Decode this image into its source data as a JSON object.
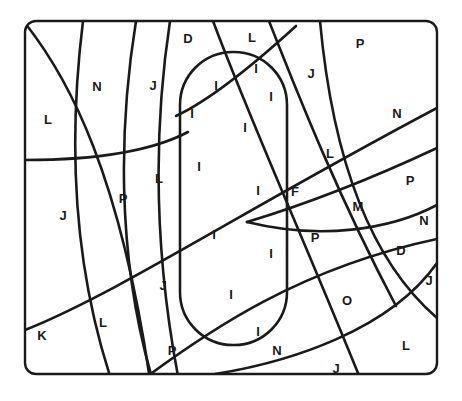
{
  "canvas": {
    "width": 462,
    "height": 401,
    "background": "#ffffff"
  },
  "style": {
    "stroke_color": "#1a1a1a",
    "frame_stroke_width": 2.4,
    "curve_stroke_width": 2.6,
    "capsule_stroke_width": 2.6,
    "label_color": "#1a1a1a",
    "label_font_size": 13,
    "label_font_weight": 700
  },
  "frame": {
    "name": "outer-rounded-rectangle",
    "x": 25,
    "y": 21,
    "width": 412,
    "height": 353,
    "corner_radius": 11
  },
  "capsule": {
    "name": "center-capsule",
    "x": 180,
    "y": 52,
    "width": 107,
    "height": 293,
    "corner_radius": 53
  },
  "curves": [
    {
      "id": "c1",
      "name": "arc-upper-left-diagonal",
      "d": "M 25 23 C 70 80 120 175 150 380"
    },
    {
      "id": "c2",
      "name": "arc-left-vertical-1",
      "d": "M 83 21 C 72 110 66 240 110 376"
    },
    {
      "id": "c3",
      "name": "arc-left-vertical-2",
      "d": "M 136 21 C 120 120 115 250 152 378"
    },
    {
      "id": "c4",
      "name": "arc-left-vertical-3",
      "d": "M 170 21 C 152 140 156 260 178 376"
    },
    {
      "id": "c5",
      "name": "arc-horizontal-left-mid",
      "d": "M 25 160 C 90 160 150 152 188 132"
    },
    {
      "id": "c6",
      "name": "arc-long-diagonal-lower-left",
      "d": "M 25 330 C 120 292 240 212 437 108"
    },
    {
      "id": "c7",
      "name": "arc-diagonal-upper-mid",
      "d": "M 213 21 C 250 120 300 230 360 378"
    },
    {
      "id": "c8",
      "name": "arc-diagonal-right-upper",
      "d": "M 269 21 C 300 100 340 200 396 306"
    },
    {
      "id": "c9",
      "name": "arc-sweep-right-1",
      "d": "M 320 21 C 330 130 358 250 437 318"
    },
    {
      "id": "c10",
      "name": "arc-horizontal-right-mid",
      "d": "M 247 222 C 320 200 390 170 437 148"
    },
    {
      "id": "c11",
      "name": "arc-horizontal-right-low",
      "d": "M 247 222 C 320 240 390 230 437 205"
    },
    {
      "id": "c12",
      "name": "arc-lower-sweep",
      "d": "M 145 378 C 210 330 300 268 437 239"
    },
    {
      "id": "c13",
      "name": "arc-bottom-right-sweep",
      "d": "M 215 374 C 290 362 390 330 437 263"
    },
    {
      "id": "c14",
      "name": "arc-capsule-diagonal",
      "d": "M 176 116 C 210 100 250 68 296 26"
    }
  ],
  "labels": [
    {
      "text": "D",
      "x": 188,
      "y": 38,
      "region": "top-center-left"
    },
    {
      "text": "L",
      "x": 252,
      "y": 37,
      "region": "top-center"
    },
    {
      "text": "P",
      "x": 360,
      "y": 43,
      "region": "top-right"
    },
    {
      "text": "N",
      "x": 97,
      "y": 86,
      "region": "upper-left"
    },
    {
      "text": "J",
      "x": 153,
      "y": 85,
      "region": "upper-left-inner"
    },
    {
      "text": "I",
      "x": 256,
      "y": 68,
      "region": "capsule-top-right"
    },
    {
      "text": "I",
      "x": 216,
      "y": 85,
      "region": "capsule-top"
    },
    {
      "text": "J",
      "x": 311,
      "y": 73,
      "region": "upper-right-inner"
    },
    {
      "text": "L",
      "x": 48,
      "y": 119,
      "region": "left-upper"
    },
    {
      "text": "I",
      "x": 192,
      "y": 113,
      "region": "capsule-upper-left"
    },
    {
      "text": "I",
      "x": 271,
      "y": 96,
      "region": "capsule-upper-right"
    },
    {
      "text": "N",
      "x": 397,
      "y": 113,
      "region": "right-upper"
    },
    {
      "text": "I",
      "x": 245,
      "y": 127,
      "region": "capsule-mid-upper"
    },
    {
      "text": "L",
      "x": 159,
      "y": 178,
      "region": "left-mid-inner"
    },
    {
      "text": "I",
      "x": 199,
      "y": 166,
      "region": "capsule-mid-left"
    },
    {
      "text": "L",
      "x": 330,
      "y": 153,
      "region": "right-mid"
    },
    {
      "text": "P",
      "x": 410,
      "y": 180,
      "region": "right-col-1"
    },
    {
      "text": "P",
      "x": 123,
      "y": 198,
      "region": "left-mid"
    },
    {
      "text": "I",
      "x": 258,
      "y": 190,
      "region": "capsule-center"
    },
    {
      "text": "F",
      "x": 295,
      "y": 191,
      "region": "right-of-capsule"
    },
    {
      "text": "J",
      "x": 63,
      "y": 215,
      "region": "left-lower-mid"
    },
    {
      "text": "M",
      "x": 358,
      "y": 206,
      "region": "right-m"
    },
    {
      "text": "N",
      "x": 424,
      "y": 220,
      "region": "right-col-2"
    },
    {
      "text": "I",
      "x": 214,
      "y": 234,
      "region": "capsule-lower-center"
    },
    {
      "text": "P",
      "x": 315,
      "y": 237,
      "region": "right-p"
    },
    {
      "text": "D",
      "x": 401,
      "y": 250,
      "region": "right-col-3"
    },
    {
      "text": "I",
      "x": 271,
      "y": 253,
      "region": "capsule-lower-right"
    },
    {
      "text": "J",
      "x": 429,
      "y": 280,
      "region": "right-col-4"
    },
    {
      "text": "J",
      "x": 163,
      "y": 285,
      "region": "left-lower-j"
    },
    {
      "text": "I",
      "x": 231,
      "y": 294,
      "region": "capsule-lower"
    },
    {
      "text": "O",
      "x": 347,
      "y": 300,
      "region": "lower-right-o"
    },
    {
      "text": "L",
      "x": 103,
      "y": 322,
      "region": "lower-left-l"
    },
    {
      "text": "I",
      "x": 258,
      "y": 331,
      "region": "capsule-bottom"
    },
    {
      "text": "K",
      "x": 42,
      "y": 335,
      "region": "bottom-left-k"
    },
    {
      "text": "L",
      "x": 406,
      "y": 345,
      "region": "bottom-right-l"
    },
    {
      "text": "P",
      "x": 172,
      "y": 350,
      "region": "bottom-p"
    },
    {
      "text": "N",
      "x": 277,
      "y": 350,
      "region": "bottom-n"
    },
    {
      "text": "J",
      "x": 336,
      "y": 368,
      "region": "bottom-j"
    }
  ]
}
